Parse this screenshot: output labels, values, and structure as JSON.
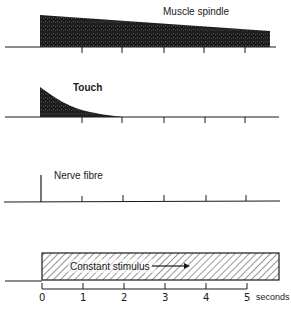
{
  "panels": [
    {
      "id": "muscle-spindle",
      "label": "Muscle spindle",
      "description": "Slowly adapting: response starts high and declines gradually over 5 seconds"
    },
    {
      "id": "touch",
      "label": "Touch",
      "description": "Rapidly adapting: response decays to zero within ~2 seconds"
    },
    {
      "id": "nerve-fibre",
      "label": "Nerve fibre",
      "description": "Single impulse at onset then nothing but tick marks"
    },
    {
      "id": "stimulus",
      "label": "Constant stimulus",
      "description": "Constant stimulus applied from 0 to 5+ seconds"
    }
  ],
  "axis": {
    "ticks": [
      "0",
      "1",
      "2",
      "3",
      "4",
      "5"
    ],
    "unit": "seconds"
  },
  "colors": {
    "ink": "#1a1a1a",
    "fill_dark": "#2a2a2a",
    "background": "#ffffff"
  }
}
